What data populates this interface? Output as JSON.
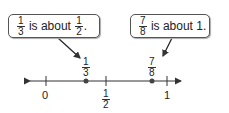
{
  "callouts": [
    {
      "frac_a_num": "1",
      "frac_a_den": "3",
      "text": " is about ",
      "frac_b_num": "1",
      "frac_b_den": "2",
      "end": "."
    },
    {
      "frac_a_num": "7",
      "frac_a_den": "8",
      "text": " is about 1."
    }
  ],
  "number_line": {
    "ticks": [
      {
        "label": "0",
        "value": 0
      },
      {
        "label_num": "1",
        "label_den": "2",
        "value": 0.5
      },
      {
        "label": "1",
        "value": 1
      }
    ],
    "points": [
      {
        "label_num": "1",
        "label_den": "3",
        "value": 0.3333
      },
      {
        "label_num": "7",
        "label_den": "8",
        "value": 0.875
      }
    ]
  }
}
